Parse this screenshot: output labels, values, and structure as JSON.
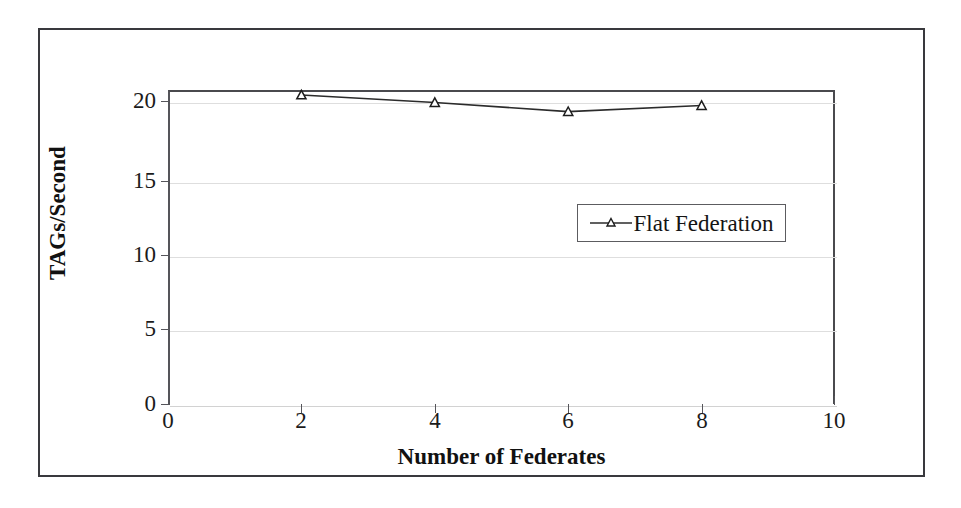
{
  "chart_data": {
    "type": "line",
    "title": "",
    "xlabel": "Number of Federates",
    "ylabel": "TAGs/Second",
    "xlim": [
      0,
      10
    ],
    "ylim": [
      0,
      20.7
    ],
    "xticks": [
      0,
      2,
      4,
      6,
      8,
      10
    ],
    "yticks": [
      0,
      5,
      10,
      15,
      20
    ],
    "xtick_labels": [
      "0",
      "2",
      "4",
      "6",
      "8",
      "10"
    ],
    "ytick_labels": [
      "0",
      "5",
      "10",
      "15",
      "20"
    ],
    "grid": "horizontal",
    "legend_position": "center",
    "series": [
      {
        "name": "Flat Federation",
        "marker": "triangle",
        "color": "#2b2b2b",
        "x": [
          2,
          4,
          6,
          8
        ],
        "values": [
          20.4,
          19.9,
          19.3,
          19.7
        ]
      }
    ]
  },
  "axes": {
    "x_title": "Number of Federates",
    "y_title": "TAGs/Second",
    "x_tick_labels": [
      "0",
      "2",
      "4",
      "6",
      "8",
      "10"
    ],
    "y_tick_labels": [
      "0",
      "5",
      "10",
      "15",
      "20"
    ]
  },
  "legend": {
    "entries": [
      {
        "label": "Flat Federation",
        "marker": "triangle-marker"
      }
    ]
  },
  "colors": {
    "series_line": "#2b2b2b",
    "gridline": "#dedede",
    "axis": "#55555a",
    "frame": "#39393d",
    "background": "#ffffff"
  }
}
